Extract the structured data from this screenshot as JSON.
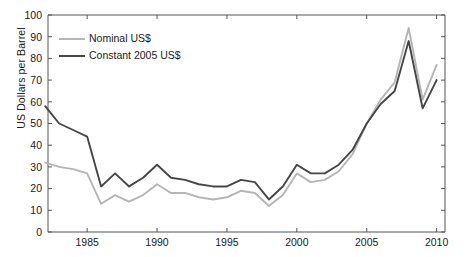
{
  "chart_data": {
    "type": "line",
    "title": "",
    "xlabel": "",
    "ylabel": "US Dollars per Barrel",
    "xlim": [
      1982.2,
      2010.6
    ],
    "ylim": [
      0,
      100
    ],
    "grid": false,
    "legend_position": "top-left",
    "xticks": [
      1985,
      1990,
      1995,
      2000,
      2005,
      2010
    ],
    "xtick_labels": [
      "1985",
      "1990",
      "1995",
      "2000",
      "2005",
      "2010"
    ],
    "yticks": [
      0,
      10,
      20,
      30,
      40,
      50,
      60,
      70,
      80,
      90,
      100
    ],
    "ytick_labels": [
      "0",
      "10",
      "20",
      "30",
      "40",
      "50",
      "60",
      "70",
      "80",
      "90",
      "100"
    ],
    "x": [
      1982,
      1983,
      1984,
      1985,
      1986,
      1987,
      1988,
      1989,
      1990,
      1991,
      1992,
      1993,
      1994,
      1995,
      1996,
      1997,
      1998,
      1999,
      2000,
      2001,
      2002,
      2003,
      2004,
      2005,
      2006,
      2007,
      2008,
      2009,
      2010
    ],
    "series": [
      {
        "name": "Nominal US$",
        "color": "#b5b5b5",
        "values": [
          32,
          30,
          29,
          27,
          13,
          17,
          14,
          17,
          22,
          18,
          18,
          16,
          15,
          16,
          19,
          18,
          12,
          17,
          27,
          23,
          24,
          28,
          36,
          50,
          61,
          69,
          94,
          61,
          77
        ]
      },
      {
        "name": "Constant 2005 US$",
        "color": "#464646",
        "values": [
          58,
          50,
          47,
          44,
          21,
          27,
          21,
          25,
          31,
          25,
          24,
          22,
          21,
          21,
          24,
          23,
          15,
          21,
          31,
          27,
          27,
          31,
          38,
          50,
          59,
          65,
          88,
          57,
          70
        ]
      }
    ]
  },
  "legend": {
    "items": [
      {
        "label": "Nominal US$",
        "color": "#b5b5b5"
      },
      {
        "label": "Constant 2005 US$",
        "color": "#464646"
      }
    ]
  }
}
